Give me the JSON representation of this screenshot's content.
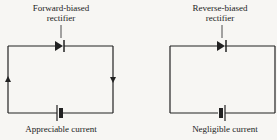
{
  "left": {
    "label_line1": "Forward-biased",
    "label_line2": "rectifier",
    "caption": "Appreciable current"
  },
  "right": {
    "label_line1": "Reverse-biased",
    "label_line2": "rectifier",
    "caption": "Negligible current"
  },
  "colors": {
    "line": "#222222",
    "background": "#f7f6f3"
  }
}
